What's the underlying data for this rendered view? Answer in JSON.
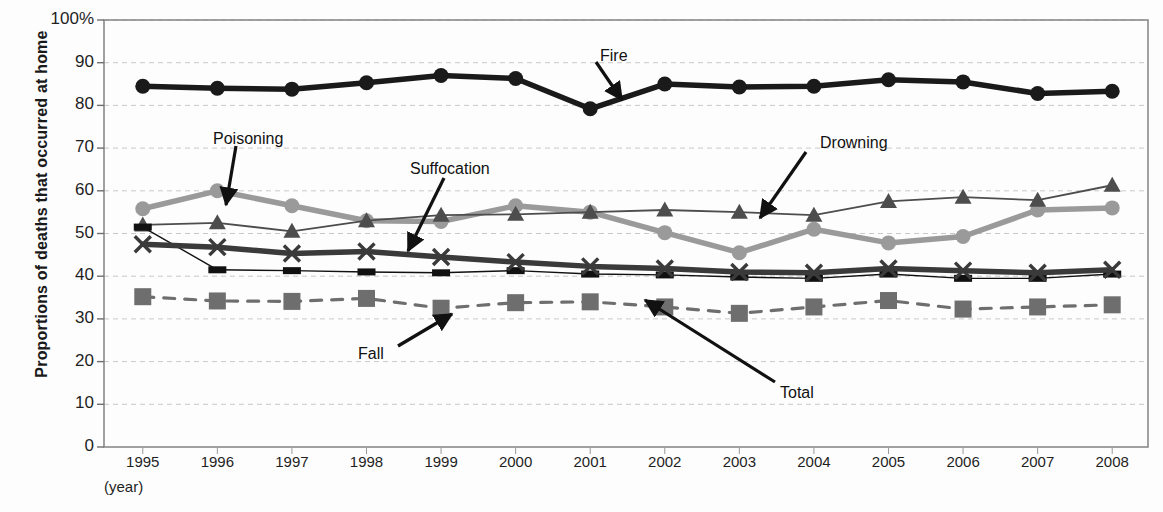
{
  "chart_data": {
    "type": "line",
    "title": "",
    "xlabel": "(year)",
    "ylabel": "Proportions of deaths that occurred at home",
    "ylim": [
      0,
      100
    ],
    "grid": true,
    "legend_position": "none (inline arrow annotations)",
    "categories": [
      "1995",
      "1996",
      "1997",
      "1998",
      "1999",
      "2000",
      "2001",
      "2002",
      "2003",
      "2004",
      "2005",
      "2006",
      "2007",
      "2008"
    ],
    "x": [
      1995,
      1996,
      1997,
      1998,
      1999,
      2000,
      2001,
      2002,
      2003,
      2004,
      2005,
      2006,
      2007,
      2008
    ],
    "series": [
      {
        "name": "Fire",
        "marker": "filled-circle",
        "color": "#1a1a1a",
        "line_style": "solid-thick",
        "values": [
          84.5,
          84.0,
          83.8,
          85.3,
          87.0,
          86.3,
          79.2,
          85.0,
          84.3,
          84.5,
          86.0,
          85.5,
          82.8,
          83.3
        ]
      },
      {
        "name": "Poisoning",
        "marker": "filled-circle",
        "color": "#9a9a9a",
        "line_style": "solid-thick",
        "values": [
          55.8,
          60.0,
          56.5,
          53.0,
          52.8,
          56.5,
          55.0,
          50.2,
          45.5,
          51.0,
          47.8,
          49.3,
          55.5,
          56.0
        ]
      },
      {
        "name": "Drowning",
        "marker": "filled-triangle",
        "color": "#4d4d4d",
        "line_style": "solid-thin",
        "values": [
          52.0,
          52.5,
          50.5,
          53.0,
          54.3,
          54.5,
          55.0,
          55.5,
          55.0,
          54.3,
          57.5,
          58.5,
          57.8,
          61.3
        ]
      },
      {
        "name": "Suffocation",
        "marker": "x-cross",
        "color": "#3a3a3a",
        "line_style": "solid-thick",
        "values": [
          47.5,
          46.8,
          45.3,
          45.8,
          44.5,
          43.3,
          42.3,
          41.8,
          41.0,
          40.8,
          41.8,
          41.3,
          40.8,
          41.5
        ]
      },
      {
        "name": "Total",
        "marker": "small-rect",
        "color": "#111111",
        "line_style": "solid-hairline",
        "values": [
          51.5,
          41.5,
          41.3,
          41.0,
          40.8,
          41.3,
          40.5,
          40.3,
          39.8,
          39.5,
          40.5,
          39.5,
          39.5,
          40.5
        ]
      },
      {
        "name": "Fall",
        "marker": "filled-square",
        "color": "#6e6e6e",
        "line_style": "dashed",
        "values": [
          35.2,
          34.2,
          34.1,
          34.8,
          32.5,
          33.8,
          34.0,
          32.8,
          31.3,
          32.8,
          34.3,
          32.3,
          32.8,
          33.3
        ]
      }
    ],
    "yticks": [
      {
        "value": 100,
        "label": "100%"
      },
      {
        "value": 90,
        "label": "90"
      },
      {
        "value": 80,
        "label": "80"
      },
      {
        "value": 70,
        "label": "70"
      },
      {
        "value": 60,
        "label": "60"
      },
      {
        "value": 50,
        "label": "50"
      },
      {
        "value": 40,
        "label": "40"
      },
      {
        "value": 30,
        "label": "30"
      },
      {
        "value": 20,
        "label": "20"
      },
      {
        "value": 10,
        "label": "10"
      },
      {
        "value": 0,
        "label": "0"
      }
    ],
    "annotations": [
      {
        "label": "Fire",
        "label_x": 600,
        "label_y": 47,
        "arrow": [
          [
            596,
            62
          ],
          [
            622,
            100
          ]
        ]
      },
      {
        "label": "Poisoning",
        "label_x": 213,
        "label_y": 130,
        "arrow": [
          [
            236,
            146
          ],
          [
            226,
            205
          ]
        ]
      },
      {
        "label": "Suffocation",
        "label_x": 410,
        "label_y": 160,
        "arrow": [
          [
            444,
            178
          ],
          [
            408,
            251
          ]
        ]
      },
      {
        "label": "Drowning",
        "label_x": 820,
        "label_y": 134,
        "arrow": [
          [
            806,
            152
          ],
          [
            760,
            218
          ]
        ]
      },
      {
        "label": "Fall",
        "label_x": 358,
        "label_y": 345,
        "arrow": [
          [
            398,
            346
          ],
          [
            452,
            314
          ]
        ]
      },
      {
        "label": "Total",
        "label_x": 780,
        "label_y": 384,
        "arrow": [
          [
            775,
            382
          ],
          [
            645,
            300
          ]
        ]
      }
    ]
  }
}
